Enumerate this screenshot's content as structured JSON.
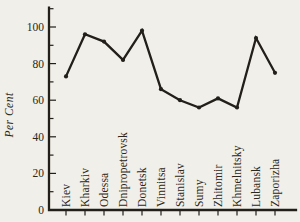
{
  "chart_data": {
    "type": "line",
    "title": "",
    "xlabel": "",
    "ylabel": "Per Cent",
    "categories": [
      "Kiev",
      "Kharkiv",
      "Odessa",
      "Dnipropetrovsk",
      "Donetsk",
      "Vinnitsa",
      "Stanislav",
      "Sumy",
      "Zhitomir",
      "Khmelnitsky",
      "Lubansk",
      "Zaporizha"
    ],
    "values": [
      73,
      96,
      92,
      82,
      98,
      66,
      60,
      56,
      61,
      56,
      94,
      75
    ],
    "ylim": [
      0,
      110
    ],
    "yticks": [
      0,
      20,
      40,
      60,
      80,
      100
    ],
    "minor_y_step": 10,
    "grid": false,
    "legend_position": "none",
    "marker": "point",
    "line_color": "#221f1a",
    "text_color": "#2a2620",
    "background_color": "#f1efe9"
  }
}
